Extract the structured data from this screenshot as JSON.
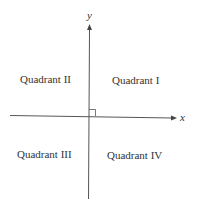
{
  "diagram": {
    "axes": {
      "x_label": "x",
      "y_label": "y"
    },
    "quadrants": [
      {
        "id": "I",
        "label": "Quadrant I"
      },
      {
        "id": "II",
        "label": "Quadrant II"
      },
      {
        "id": "III",
        "label": "Quadrant III"
      },
      {
        "id": "IV",
        "label": "Quadrant IV"
      }
    ],
    "colors": {
      "line": "#555555",
      "text": "#333333",
      "background": "#ffffff"
    }
  }
}
